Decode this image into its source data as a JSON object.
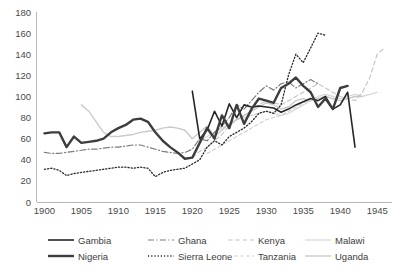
{
  "chart_data": {
    "type": "line",
    "title": "",
    "subtitle": "",
    "xlabel": "",
    "ylabel": "",
    "xlim": [
      1899,
      1947
    ],
    "ylim": [
      0,
      180
    ],
    "x_ticks": [
      1900,
      1905,
      1910,
      1915,
      1920,
      1925,
      1930,
      1935,
      1940,
      1945
    ],
    "y_ticks": [
      0,
      20,
      40,
      60,
      80,
      100,
      120,
      140,
      160,
      180
    ],
    "grid": false,
    "legend_position": "bottom",
    "series": [
      {
        "name": "Gambia",
        "color": "#262626",
        "width": 1.6,
        "dash": "none",
        "x": [
          1920,
          1921,
          1922,
          1923,
          1924,
          1925,
          1926,
          1927,
          1928,
          1929,
          1930,
          1931,
          1932,
          1933,
          1934,
          1935,
          1936,
          1937,
          1938,
          1939,
          1940,
          1941,
          1942
        ],
        "y": [
          105,
          60,
          68,
          86,
          72,
          93,
          80,
          92,
          90,
          91,
          90,
          89,
          85,
          88,
          92,
          95,
          98,
          96,
          100,
          88,
          92,
          104,
          52
        ]
      },
      {
        "name": "Ghana",
        "color": "#7d7d7d",
        "width": 1.2,
        "dash": "dashdot",
        "x": [
          1900,
          1901,
          1902,
          1903,
          1904,
          1905,
          1906,
          1907,
          1908,
          1909,
          1910,
          1911,
          1912,
          1913,
          1914,
          1915,
          1916,
          1917,
          1918,
          1919,
          1920,
          1921,
          1922,
          1923,
          1924,
          1925,
          1926,
          1927,
          1928,
          1929,
          1930,
          1931,
          1932,
          1933,
          1934,
          1935,
          1936,
          1937
        ],
        "y": [
          47,
          46,
          46,
          47,
          48,
          49,
          50,
          50,
          51,
          52,
          52,
          53,
          54,
          54,
          52,
          50,
          48,
          47,
          46,
          47,
          50,
          60,
          58,
          66,
          72,
          80,
          92,
          88,
          96,
          104,
          110,
          106,
          112,
          114,
          108,
          112,
          116,
          112
        ]
      },
      {
        "name": "Kenya",
        "color": "#c2c2c2",
        "width": 1.1,
        "dash": "dashed",
        "x": [
          1920,
          1921,
          1922,
          1923,
          1924,
          1925,
          1926,
          1927,
          1928,
          1929,
          1930,
          1931,
          1932,
          1933,
          1934,
          1935,
          1936,
          1937,
          1938,
          1939,
          1940,
          1941,
          1942,
          1943,
          1944,
          1945,
          1946
        ],
        "y": [
          42,
          48,
          52,
          58,
          64,
          72,
          78,
          82,
          86,
          92,
          96,
          94,
          92,
          96,
          100,
          104,
          108,
          112,
          108,
          104,
          100,
          98,
          96,
          104,
          118,
          140,
          146
        ]
      },
      {
        "name": "Malawi",
        "color": "#d8d8d8",
        "width": 1.2,
        "dash": "none",
        "x": [
          1921,
          1922,
          1923,
          1924,
          1925,
          1926,
          1927,
          1928,
          1929,
          1930,
          1931,
          1932,
          1933,
          1934,
          1935,
          1936,
          1937,
          1938,
          1939,
          1940,
          1941,
          1942,
          1943,
          1944,
          1945
        ],
        "y": [
          58,
          62,
          66,
          70,
          74,
          78,
          80,
          82,
          84,
          86,
          84,
          82,
          84,
          88,
          92,
          96,
          100,
          102,
          100,
          98,
          100,
          102,
          100,
          102,
          104
        ]
      },
      {
        "name": "Nigeria",
        "color": "#3d3d3d",
        "width": 2.4,
        "dash": "none",
        "x": [
          1900,
          1901,
          1902,
          1903,
          1904,
          1905,
          1906,
          1907,
          1908,
          1909,
          1910,
          1911,
          1912,
          1913,
          1914,
          1915,
          1916,
          1917,
          1918,
          1919,
          1920,
          1921,
          1922,
          1923,
          1924,
          1925,
          1926,
          1927,
          1928,
          1929,
          1930,
          1931,
          1932,
          1933,
          1934,
          1935,
          1936,
          1937,
          1938,
          1939,
          1940,
          1941
        ],
        "y": [
          65,
          66,
          66,
          52,
          62,
          56,
          57,
          58,
          60,
          66,
          70,
          73,
          78,
          79,
          76,
          66,
          58,
          52,
          47,
          41,
          42,
          56,
          70,
          60,
          82,
          70,
          92,
          74,
          88,
          98,
          96,
          94,
          108,
          112,
          118,
          110,
          104,
          90,
          98,
          88,
          108,
          110
        ]
      },
      {
        "name": "Sierra Leone",
        "color": "#2b2b2b",
        "width": 1.3,
        "dash": "dotted",
        "x": [
          1900,
          1901,
          1902,
          1903,
          1904,
          1905,
          1906,
          1907,
          1908,
          1909,
          1910,
          1911,
          1912,
          1913,
          1914,
          1915,
          1916,
          1917,
          1918,
          1919,
          1920,
          1921,
          1922,
          1923,
          1924,
          1925,
          1926,
          1927,
          1928,
          1929,
          1930,
          1931,
          1932,
          1933,
          1934,
          1935,
          1936,
          1937,
          1938
        ],
        "y": [
          31,
          32,
          30,
          25,
          27,
          28,
          29,
          30,
          31,
          32,
          33,
          33,
          32,
          33,
          32,
          24,
          28,
          30,
          31,
          32,
          36,
          40,
          52,
          58,
          54,
          62,
          66,
          70,
          76,
          84,
          86,
          84,
          92,
          120,
          140,
          132,
          146,
          160,
          158
        ]
      },
      {
        "name": "Tanzania",
        "color": "#cfcfcf",
        "width": 1.1,
        "dash": "dashed-light",
        "x": [
          1922,
          1923,
          1924,
          1925,
          1926,
          1927,
          1928,
          1929,
          1930,
          1931,
          1932,
          1933,
          1934,
          1935,
          1936,
          1937,
          1938,
          1939,
          1940,
          1941,
          1942
        ],
        "y": [
          46,
          50,
          54,
          58,
          62,
          66,
          70,
          74,
          78,
          80,
          82,
          86,
          90,
          94,
          96,
          98,
          100,
          98,
          96,
          98,
          100
        ]
      },
      {
        "name": "Uganda",
        "color": "#cacaca",
        "width": 1.4,
        "dash": "none",
        "x": [
          1905,
          1906,
          1907,
          1908,
          1909,
          1910,
          1911,
          1912,
          1913,
          1914,
          1915,
          1916,
          1917,
          1918,
          1919,
          1920,
          1921,
          1922,
          1923,
          1924,
          1925,
          1926,
          1927,
          1928,
          1929,
          1930,
          1931,
          1932,
          1933,
          1934,
          1935,
          1936,
          1937,
          1938,
          1939,
          1940,
          1941,
          1942,
          1943
        ],
        "y": [
          92,
          86,
          76,
          66,
          62,
          62,
          63,
          64,
          66,
          67,
          68,
          70,
          71,
          70,
          68,
          60,
          66,
          72,
          62,
          68,
          74,
          78,
          82,
          86,
          90,
          94,
          92,
          88,
          90,
          96,
          98,
          96,
          98,
          100,
          98,
          96,
          98,
          100,
          100
        ]
      }
    ]
  },
  "legend": {
    "items": [
      {
        "label": "Gambia"
      },
      {
        "label": "Ghana"
      },
      {
        "label": "Kenya"
      },
      {
        "label": "Malawi"
      },
      {
        "label": "Nigeria"
      },
      {
        "label": "Sierra Leone"
      },
      {
        "label": "Tanzania"
      },
      {
        "label": "Uganda"
      }
    ]
  }
}
